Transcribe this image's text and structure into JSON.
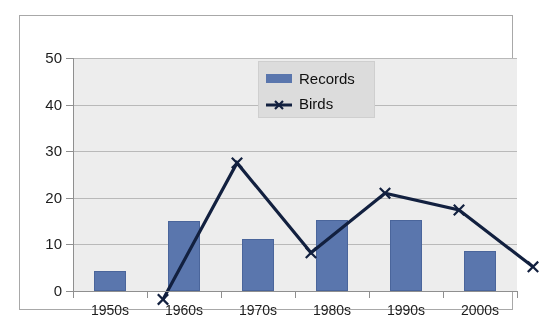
{
  "chart_data": {
    "type": "bar",
    "title": "",
    "subtitle": "",
    "xlabel": "",
    "ylabel": "",
    "categories": [
      "1950s",
      "1960s",
      "1970s",
      "1980s",
      "1990s",
      "2000s"
    ],
    "ylim": [
      0,
      50
    ],
    "y_ticks": [
      0,
      10,
      20,
      30,
      40,
      50
    ],
    "y_tick_labels": [
      "0",
      "10",
      "20",
      "30",
      "40",
      "50"
    ],
    "grid": true,
    "legend_position": "top-center",
    "series": [
      {
        "name": "Records",
        "type": "bar",
        "color": "#5A76AD",
        "values": [
          4.2,
          15,
          11.2,
          15.2,
          15.2,
          8.5
        ]
      },
      {
        "name": "Birds",
        "type": "line",
        "color": "#12203F",
        "marker": "x",
        "values": [
          7.2,
          36.5,
          17.2,
          30,
          26.4,
          14.2
        ]
      }
    ]
  },
  "legend": {
    "items": [
      {
        "label": "Records",
        "icon": "bar-swatch-icon"
      },
      {
        "label": "Birds",
        "icon": "line-marker-x-icon"
      }
    ]
  },
  "colors": {
    "bar_fill": "#5A76AD",
    "line_stroke": "#12203F",
    "plot_background": "#EDEDED",
    "grid": "#B9B9B9",
    "frame_border": "#A8A8A8",
    "page_background": "#FFFFFF",
    "legend_background": "#DCDCDC",
    "text": "#1D1D1D"
  }
}
